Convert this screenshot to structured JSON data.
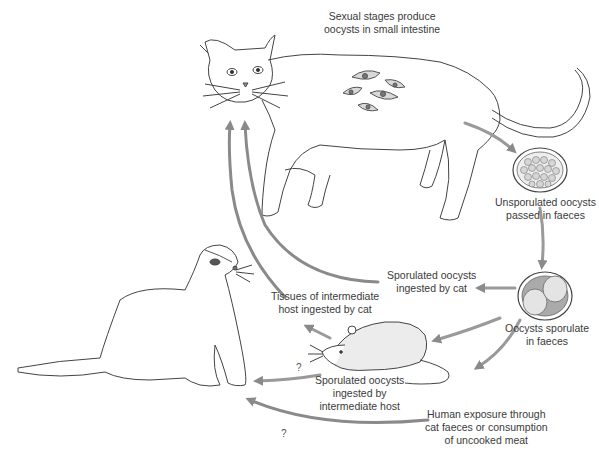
{
  "diagram": {
    "labels": {
      "sexual_stages": [
        "Sexual stages produce",
        "oocysts in small intestine"
      ],
      "unsporulated": [
        "Unsporulated oocysts",
        "passed in faeces"
      ],
      "sporulate": [
        "Oocysts sporulate",
        "in faeces"
      ],
      "ingested_by_cat": [
        "Sporulated oocysts",
        "ingested by cat"
      ],
      "tissues": [
        "Tissues of intermediate",
        "host ingested by cat"
      ],
      "ingested_intermediate": [
        "Sporulated oocysts",
        "ingested by",
        "intermediate host"
      ],
      "human_exposure": [
        "Human exposure through",
        "cat faeces or consumption",
        "of uncooked meat"
      ],
      "question_upper": "?",
      "question_lower": "?"
    },
    "figures": [
      "cat",
      "ferret",
      "mouse",
      "unsporulated-oocyst",
      "sporulated-oocyst",
      "intestinal-stages"
    ],
    "colors": {
      "arrow": "#9a9a9a",
      "arrow_dark": "#7d7d7d",
      "line": "#333333",
      "oocyst_fill": "#d9d9d9"
    }
  }
}
